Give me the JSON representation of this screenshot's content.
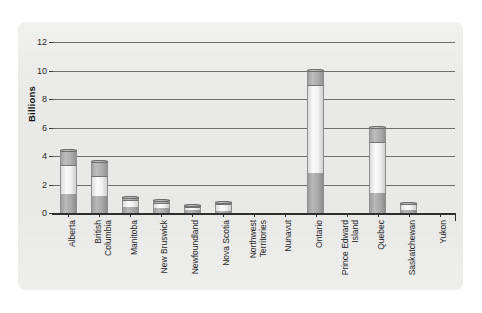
{
  "chart_data": {
    "type": "bar",
    "subtype": "stacked-vertical",
    "title": "",
    "xlabel": "",
    "ylabel": "Billions",
    "ylim": [
      0,
      12
    ],
    "yticks": [
      0,
      2,
      4,
      6,
      8,
      10,
      12
    ],
    "ytick_labels": [
      "0",
      "2",
      "4",
      "6",
      "8",
      "10",
      "12"
    ],
    "grid": "horizontal",
    "legend": "none",
    "categories": [
      "Alberta",
      "British Columbia",
      "Manitoba",
      "New Bruswick",
      "Newfoundland",
      "Nova Scotia",
      "Northwest Territories",
      "Nunavut",
      "Ontario",
      "Prince Edward Island",
      "Quebec",
      "Saskatchewan",
      "Yukon"
    ],
    "category_label_lines": [
      [
        "Alberta"
      ],
      [
        "British",
        "Columbia"
      ],
      [
        "Manitoba"
      ],
      [
        "New Bruswick"
      ],
      [
        "Newfoundland"
      ],
      [
        "Nova Scotia"
      ],
      [
        "Northwest",
        "Territories"
      ],
      [
        "Nunavut"
      ],
      [
        "Ontario"
      ],
      [
        "Prince Edward",
        "Island"
      ],
      [
        "Quebec"
      ],
      [
        "Saskatchewan"
      ],
      [
        "Yukon"
      ]
    ],
    "series": [
      {
        "name": "segment-1-bottom",
        "color": "#a6a6a6",
        "values": [
          1.3,
          1.2,
          0.4,
          0.35,
          0.2,
          0.15,
          0.0,
          0.0,
          2.8,
          0.0,
          1.4,
          0.2,
          0.0
        ]
      },
      {
        "name": "segment-2-middle",
        "color": "#f4f4f4",
        "values": [
          2.1,
          1.4,
          0.5,
          0.35,
          0.2,
          0.45,
          0.0,
          0.0,
          6.2,
          0.0,
          3.6,
          0.4,
          0.0
        ]
      },
      {
        "name": "segment-3-top",
        "color": "#ababab",
        "values": [
          1.0,
          1.0,
          0.2,
          0.2,
          0.1,
          0.15,
          0.0,
          0.0,
          1.0,
          0.0,
          1.0,
          0.1,
          0.0
        ]
      }
    ],
    "totals": [
      4.4,
      3.6,
      1.1,
      0.9,
      0.5,
      0.75,
      0.0,
      0.0,
      10.0,
      0.0,
      6.0,
      0.7,
      0.0
    ]
  },
  "colors": {
    "panel_background": "#e9e9e7",
    "page_background": "#ffffff",
    "gridline": "#6f6f6f",
    "axis": "#2e2e2e",
    "text": "#1f1f1f",
    "bar_dark": "#a6a6a6",
    "bar_light": "#f4f4f4",
    "bar_top": "#ababab"
  }
}
